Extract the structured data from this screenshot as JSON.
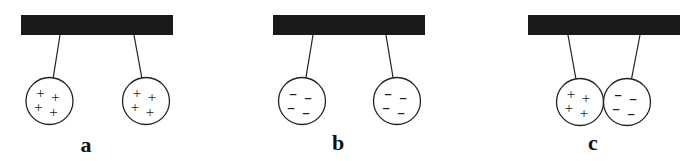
{
  "diagram": {
    "colors": {
      "bar": "#1a1a1a",
      "line": "#222222",
      "background": "#ffffff"
    },
    "panels": [
      {
        "id": "a",
        "label": "a",
        "bar": {
          "x": 21,
          "y": 15,
          "w": 152,
          "h": 20
        },
        "spheres": [
          {
            "cx": 49.5,
            "cy": 101,
            "r": 23.5,
            "charge": "positive",
            "symbol": "+",
            "count": 4,
            "string_top": [
              60,
              35
            ]
          },
          {
            "cx": 146,
            "cy": 101,
            "r": 23.5,
            "charge": "positive",
            "symbol": "+",
            "count": 4,
            "string_top": [
              134,
              35
            ]
          }
        ],
        "interaction": "repel",
        "label_pos": [
          86,
          152
        ]
      },
      {
        "id": "b",
        "label": "b",
        "bar": {
          "x": 273,
          "y": 15,
          "w": 152,
          "h": 20
        },
        "spheres": [
          {
            "cx": 302,
            "cy": 101,
            "r": 23.5,
            "charge": "negative",
            "symbol": "-",
            "count": 4,
            "string_top": [
              313,
              35
            ]
          },
          {
            "cx": 397,
            "cy": 101,
            "r": 23.5,
            "charge": "negative",
            "symbol": "-",
            "count": 4,
            "string_top": [
              386,
              35
            ]
          }
        ],
        "interaction": "repel",
        "label_pos": [
          338,
          150
        ]
      },
      {
        "id": "c",
        "label": "c",
        "bar": {
          "x": 528,
          "y": 15,
          "w": 152,
          "h": 20
        },
        "spheres": [
          {
            "cx": 580,
            "cy": 102,
            "r": 23.5,
            "charge": "positive",
            "symbol": "+",
            "count": 4,
            "string_top": [
              568,
              35
            ]
          },
          {
            "cx": 627,
            "cy": 102,
            "r": 23.5,
            "charge": "negative",
            "symbol": "-",
            "count": 4,
            "string_top": [
              640,
              35
            ]
          }
        ],
        "interaction": "attract",
        "label_pos": [
          593,
          150
        ]
      }
    ]
  }
}
